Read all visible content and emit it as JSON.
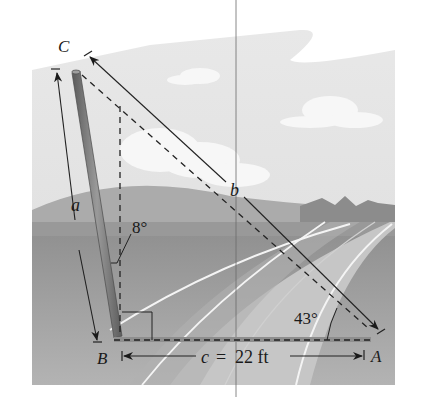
{
  "figure": {
    "vertices": {
      "A": "A",
      "B": "B",
      "C": "C"
    },
    "sides": {
      "a": "a",
      "b": "b",
      "c_label": "c = 22 ft",
      "c_var": "c",
      "c_eq": "=",
      "c_value": "22 ft"
    },
    "angles": {
      "lean": "8°",
      "at_A": "43°"
    },
    "colors": {
      "sky": "#e6e6e6",
      "cloud": "#f6f6f6",
      "hills_far": "#a8a8a8",
      "mountains": "#8c8c8c",
      "ground": "#9a9a9a",
      "road": "#c4c4c4",
      "pole": "#7a7a7a",
      "line": "#222222"
    }
  }
}
